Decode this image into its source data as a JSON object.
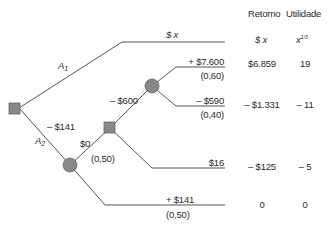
{
  "diagram": {
    "type": "decision-tree",
    "colors": {
      "line": "#555555",
      "node_fill": "#888888",
      "node_stroke": "#666666",
      "text": "#2a2a2a"
    },
    "columns": {
      "return_header": "Retorno",
      "utility_header": "Utilidade",
      "return_formula": "$ x",
      "utility_formula_base": "x",
      "utility_formula_exp": "1/3"
    },
    "branches": {
      "a1": {
        "label_main": "A",
        "label_sub": "1",
        "payoff": "$ x"
      },
      "a2": {
        "label_main": "A",
        "label_sub": "2",
        "cost": "– $141"
      },
      "chance_up": {
        "value": "$0",
        "prob": "(0,50)"
      },
      "chance_down": {
        "value": "+ $141",
        "prob": "(0,50)"
      },
      "decision_up": {
        "value": "– $600"
      },
      "decision_down": {
        "value": "$16"
      },
      "outcome_win": {
        "value": "+ $7.600",
        "prob": "(0,60)"
      },
      "outcome_lose": {
        "value": "– $590",
        "prob": "(0,40)"
      }
    },
    "rows": [
      {
        "name": "win",
        "return": "$6.859",
        "utility": "19"
      },
      {
        "name": "lose",
        "return": "– $1.331",
        "utility": "– 11"
      },
      {
        "name": "decline",
        "return": "– $125",
        "utility": "– 5"
      },
      {
        "name": "no-lawsuit",
        "return": "0",
        "utility": "0"
      }
    ]
  }
}
